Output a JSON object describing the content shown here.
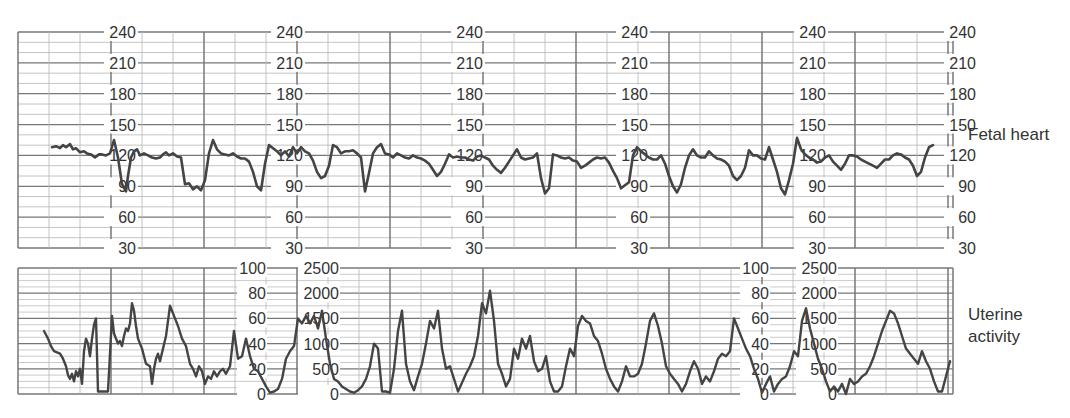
{
  "labels": {
    "fetal_heart": "Fetal heart",
    "uterine_line1": "Uterine",
    "uterine_line2": "activity"
  },
  "colors": {
    "trace": "#444444",
    "grid_major": "#777777",
    "grid_minor": "#b5b5b5",
    "text": "#333333"
  },
  "chart_data": [
    {
      "type": "line",
      "title": "Fetal heart",
      "ylabel": "Fetal heart rate (bpm)",
      "ylim": [
        30,
        240
      ],
      "yticks": [
        240,
        210,
        180,
        150,
        120,
        90,
        60,
        30
      ],
      "tick_label_columns_x": [
        105,
        272,
        452,
        617,
        795,
        945
      ],
      "grid": true,
      "x": [
        52,
        56,
        60,
        63,
        66,
        70,
        73,
        76,
        80,
        84,
        87,
        91,
        95,
        99,
        102,
        106,
        110,
        114,
        118,
        122,
        126,
        128,
        131,
        134,
        137,
        140,
        144,
        148,
        152,
        156,
        160,
        163,
        166,
        169,
        173,
        177,
        181,
        185,
        189,
        193,
        197,
        201,
        205,
        209,
        213,
        217,
        221,
        225,
        229,
        233,
        237,
        241,
        245,
        249,
        253,
        257,
        261,
        265,
        269,
        273,
        277,
        281,
        285,
        289,
        293,
        297,
        301,
        305,
        309,
        313,
        317,
        321,
        325,
        329,
        333,
        337,
        341,
        345,
        349,
        353,
        357,
        361,
        365,
        369,
        373,
        377,
        381,
        385,
        389,
        393,
        397,
        401,
        405,
        409,
        413,
        417,
        421,
        425,
        429,
        433,
        437,
        441,
        445,
        449,
        453,
        457,
        461,
        465,
        469,
        473,
        477,
        481,
        485,
        489,
        493,
        497,
        501,
        505,
        509,
        513,
        517,
        521,
        525,
        529,
        533,
        537,
        541,
        545,
        549,
        553,
        557,
        561,
        565,
        569,
        573,
        577,
        581,
        585,
        589,
        593,
        597,
        601,
        605,
        609,
        613,
        617,
        621,
        625,
        629,
        633,
        637,
        641,
        645,
        649,
        653,
        657,
        661,
        665,
        669,
        673,
        677,
        681,
        685,
        689,
        693,
        697,
        701,
        705,
        709,
        713,
        717,
        721,
        725,
        729,
        733,
        737,
        741,
        745,
        749,
        753,
        757,
        761,
        765,
        769,
        773,
        777,
        781,
        785,
        789,
        793,
        797,
        801,
        805,
        809,
        813,
        817,
        821,
        825,
        829,
        833,
        837,
        841,
        845,
        849,
        853,
        857,
        861,
        865,
        869,
        873,
        877,
        881,
        885,
        889,
        893,
        897,
        901,
        905,
        909,
        913,
        917,
        921,
        925,
        929,
        933,
        937,
        941,
        945,
        949,
        953
      ],
      "values": [
        128,
        129,
        127,
        130,
        128,
        131,
        126,
        127,
        123,
        124,
        122,
        121,
        118,
        121,
        121,
        120,
        122,
        135,
        118,
        92,
        85,
        100,
        118,
        124,
        126,
        120,
        122,
        120,
        118,
        117,
        118,
        121,
        123,
        120,
        122,
        119,
        118,
        92,
        93,
        87,
        90,
        86,
        96,
        122,
        135,
        126,
        122,
        121,
        120,
        122,
        119,
        117,
        117,
        114,
        104,
        90,
        86,
        112,
        130,
        127,
        124,
        120,
        124,
        119,
        128,
        122,
        128,
        124,
        122,
        115,
        104,
        98,
        100,
        110,
        130,
        128,
        122,
        124,
        124,
        125,
        122,
        118,
        85,
        103,
        122,
        128,
        131,
        122,
        121,
        118,
        122,
        120,
        118,
        117,
        120,
        118,
        117,
        115,
        112,
        106,
        100,
        104,
        112,
        121,
        118,
        119,
        118,
        118,
        116,
        115,
        119,
        120,
        118,
        116,
        110,
        106,
        103,
        108,
        114,
        120,
        126,
        118,
        116,
        117,
        118,
        122,
        98,
        83,
        88,
        121,
        120,
        118,
        117,
        118,
        115,
        114,
        108,
        110,
        113,
        116,
        118,
        117,
        118,
        113,
        105,
        98,
        88,
        91,
        94,
        120,
        128,
        124,
        121,
        118,
        116,
        116,
        120,
        112,
        100,
        90,
        84,
        92,
        108,
        120,
        126,
        120,
        118,
        118,
        124,
        120,
        117,
        116,
        114,
        110,
        100,
        96,
        100,
        108,
        125,
        120,
        120,
        117,
        116,
        128,
        116,
        104,
        88,
        82,
        96,
        112,
        137,
        126,
        121,
        118,
        116,
        113,
        114,
        118,
        120,
        114,
        110,
        106,
        112,
        120,
        120,
        119,
        116,
        114,
        112,
        110,
        108,
        112,
        116,
        116,
        120,
        122,
        121,
        118,
        116,
        110,
        100,
        104,
        118,
        128,
        130
      ]
    },
    {
      "type": "line",
      "title": "Uterine activity",
      "ylabel": "Uterine activity",
      "axes": [
        {
          "ylim": [
            0,
            100
          ],
          "yticks": [
            100,
            80,
            60,
            40,
            20,
            0
          ],
          "tick_label_columns_x": [
            237,
            740
          ]
        },
        {
          "ylim": [
            0,
            2500
          ],
          "yticks": [
            2500,
            2000,
            1500,
            1000,
            500,
            0
          ],
          "tick_label_columns_x": [
            298,
            796
          ]
        }
      ],
      "grid": true,
      "x": [
        44,
        48,
        51,
        54,
        57,
        60,
        63,
        66,
        68,
        70,
        72,
        74,
        76,
        78,
        80,
        82,
        84,
        86,
        88,
        90,
        92,
        94,
        96,
        98,
        100,
        104,
        108,
        112,
        114,
        116,
        118,
        120,
        122,
        124,
        126,
        128,
        130,
        132,
        134,
        136,
        138,
        142,
        146,
        150,
        152,
        154,
        156,
        158,
        160,
        163,
        166,
        170,
        174,
        178,
        182,
        186,
        190,
        193,
        196,
        199,
        202,
        205,
        208,
        211,
        214,
        217,
        220,
        223,
        226,
        230,
        234,
        238,
        242,
        246,
        250,
        254,
        258,
        262,
        266,
        270,
        274,
        278,
        282,
        286,
        290,
        294,
        298,
        302,
        306,
        310,
        314,
        318,
        322,
        326,
        330,
        334,
        338,
        342,
        346,
        350,
        354,
        358,
        362,
        366,
        370,
        374,
        378,
        382,
        386,
        390,
        394,
        398,
        402,
        406,
        410,
        414,
        418,
        422,
        426,
        430,
        434,
        438,
        442,
        446,
        450,
        454,
        458,
        462,
        466,
        470,
        474,
        478,
        482,
        486,
        490,
        494,
        498,
        502,
        506,
        510,
        514,
        518,
        522,
        526,
        530,
        534,
        538,
        542,
        546,
        550,
        554,
        558,
        562,
        566,
        570,
        574,
        578,
        582,
        586,
        590,
        594,
        598,
        602,
        606,
        610,
        614,
        618,
        622,
        626,
        630,
        634,
        638,
        642,
        646,
        650,
        654,
        658,
        662,
        666,
        670,
        674,
        678,
        682,
        686,
        690,
        694,
        698,
        702,
        706,
        710,
        714,
        718,
        722,
        726,
        730,
        734,
        738,
        742,
        746,
        750,
        754,
        758,
        762,
        766,
        770,
        774,
        778,
        782,
        786,
        790,
        794,
        798,
        802,
        806,
        810,
        814,
        818,
        822,
        826,
        830,
        834,
        838,
        842,
        846,
        850,
        854,
        858,
        862,
        866,
        870,
        874,
        878,
        882,
        886,
        890,
        894,
        898,
        902,
        906,
        910,
        914,
        918,
        922,
        926,
        930,
        934,
        938,
        942,
        946,
        950
      ],
      "values": [
        50,
        44,
        38,
        34,
        33,
        32,
        28,
        22,
        15,
        12,
        16,
        10,
        18,
        14,
        20,
        8,
        34,
        44,
        40,
        30,
        44,
        55,
        60,
        2,
        2,
        2,
        2,
        62,
        48,
        44,
        40,
        42,
        38,
        46,
        52,
        50,
        56,
        72,
        66,
        54,
        44,
        36,
        24,
        22,
        8,
        20,
        28,
        32,
        26,
        36,
        46,
        70,
        62,
        54,
        44,
        38,
        24,
        20,
        14,
        22,
        18,
        8,
        14,
        12,
        18,
        14,
        18,
        20,
        16,
        22,
        50,
        28,
        30,
        44,
        30,
        20,
        18,
        12,
        6,
        1,
        2,
        4,
        12,
        28,
        34,
        38,
        60,
        56,
        62,
        56,
        62,
        52,
        66,
        44,
        24,
        12,
        10,
        6,
        4,
        2,
        1,
        3,
        6,
        12,
        22,
        40,
        36,
        2,
        2,
        1,
        20,
        50,
        66,
        24,
        10,
        3,
        14,
        24,
        40,
        58,
        52,
        66,
        36,
        20,
        22,
        12,
        2,
        9,
        16,
        22,
        30,
        46,
        72,
        64,
        82,
        58,
        24,
        16,
        6,
        12,
        36,
        28,
        44,
        36,
        46,
        26,
        18,
        20,
        30,
        10,
        2,
        2,
        6,
        22,
        36,
        30,
        54,
        62,
        58,
        56,
        46,
        42,
        32,
        20,
        12,
        6,
        2,
        10,
        22,
        14,
        14,
        16,
        24,
        40,
        58,
        64,
        54,
        40,
        22,
        16,
        12,
        8,
        2,
        8,
        18,
        26,
        20,
        8,
        14,
        10,
        18,
        28,
        32,
        30,
        34,
        60,
        52,
        44,
        36,
        30,
        20,
        12,
        1,
        8,
        14,
        2,
        8,
        12,
        14,
        22,
        34,
        30,
        58,
        68,
        52,
        40,
        28,
        20,
        10,
        2,
        6,
        2,
        8,
        0,
        12,
        8,
        10,
        14,
        16,
        22,
        30,
        40,
        50,
        58,
        66,
        64,
        56,
        46,
        36,
        32,
        28,
        24,
        34,
        26,
        20,
        10,
        2,
        2,
        14,
        26,
        20,
        12,
        2,
        0,
        18,
        30,
        24,
        18,
        10,
        2,
        8,
        14,
        22,
        30,
        36,
        48,
        62,
        74,
        82,
        82,
        60,
        40,
        30,
        22,
        14,
        10,
        6,
        8,
        2,
        0,
        -4,
        0,
        30,
        20,
        74,
        78,
        84,
        60,
        38,
        30,
        24
      ]
    }
  ]
}
